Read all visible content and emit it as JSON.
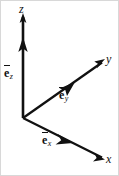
{
  "figure": {
    "type": "vector-diagram",
    "width": 119,
    "height": 176,
    "background_color": "#ffffff",
    "stroke_color": "#111111",
    "border_color": "#d8d8d8"
  },
  "origin": {
    "x": 22,
    "y": 117
  },
  "axes": [
    {
      "name": "z-axis",
      "label": "z",
      "direction": "up",
      "tip": {
        "x": 22,
        "y": 14
      },
      "basis_vector": {
        "symbol": "e",
        "subscript": "z",
        "overbar": true,
        "arrow_tip": {
          "x": 22,
          "y": 38
        }
      }
    },
    {
      "name": "y-axis",
      "label": "y",
      "direction": "up-right",
      "tip": {
        "x": 103,
        "y": 60
      },
      "basis_vector": {
        "symbol": "e",
        "subscript": "y",
        "overbar": true,
        "arrow_tip": {
          "x": 72,
          "y": 83
        }
      }
    },
    {
      "name": "x-axis",
      "label": "x",
      "direction": "down-right",
      "tip": {
        "x": 103,
        "y": 158
      },
      "basis_vector": {
        "symbol": "e",
        "subscript": "x",
        "overbar": true,
        "arrow_tip": {
          "x": 70,
          "y": 142
        }
      }
    }
  ],
  "labels": {
    "z_axis": "z",
    "y_axis": "y",
    "x_axis": "x",
    "basis_symbol": "e",
    "basis_z_subscript": "z",
    "basis_y_subscript": "y",
    "basis_x_subscript": "x"
  }
}
